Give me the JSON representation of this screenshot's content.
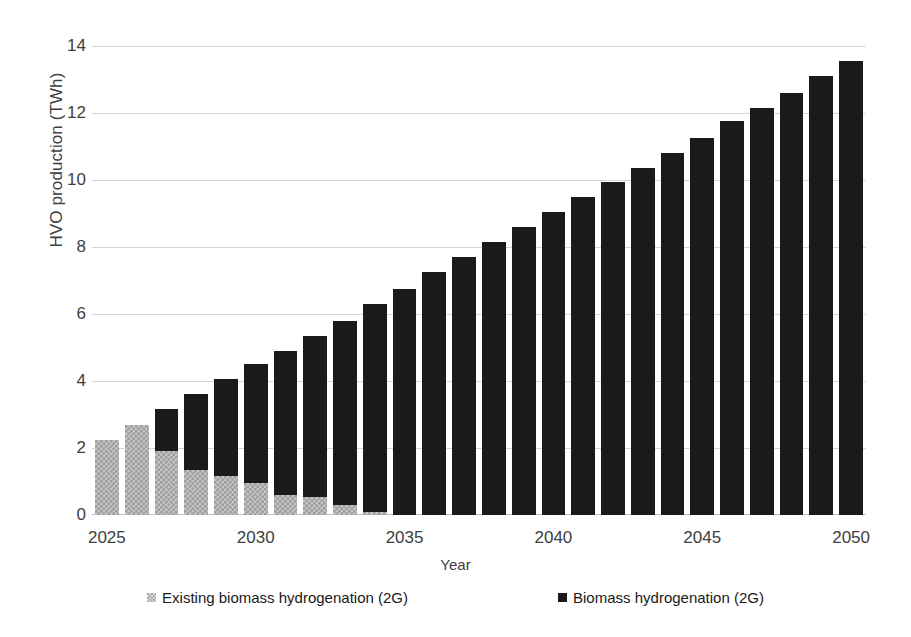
{
  "chart_data": {
    "type": "bar",
    "stacked": true,
    "title": "",
    "xlabel": "Year",
    "ylabel": "HVO production (TWh)",
    "categories": [
      2025,
      2026,
      2027,
      2028,
      2029,
      2030,
      2031,
      2032,
      2033,
      2034,
      2035,
      2036,
      2037,
      2038,
      2039,
      2040,
      2041,
      2042,
      2043,
      2044,
      2045,
      2046,
      2047,
      2048,
      2049,
      2050
    ],
    "x_tick_labels": [
      "2025",
      "2030",
      "2035",
      "2040",
      "2045",
      "2050"
    ],
    "x_tick_categories": [
      2025,
      2030,
      2035,
      2040,
      2045,
      2050
    ],
    "y_tick_labels": [
      "0",
      "2",
      "4",
      "6",
      "8",
      "10",
      "12",
      "14"
    ],
    "ylim": [
      0,
      14
    ],
    "y_tick_values": [
      0,
      2,
      4,
      6,
      8,
      10,
      12,
      14
    ],
    "grid": true,
    "legend_position": "bottom",
    "series": [
      {
        "name": "Existing biomass hydrogenation (2G)",
        "color": "#a8a8a8",
        "pattern": "checkered",
        "values": [
          2.25,
          2.7,
          1.9,
          1.35,
          1.15,
          0.95,
          0.6,
          0.55,
          0.3,
          0.1,
          0.0,
          0.0,
          0.0,
          0.0,
          0.0,
          0.0,
          0.0,
          0.0,
          0.0,
          0.0,
          0.0,
          0.0,
          0.0,
          0.0,
          0.0,
          0.0
        ]
      },
      {
        "name": "Biomass hydrogenation (2G)",
        "color": "#1a1a1a",
        "pattern": "solid",
        "values": [
          0.0,
          0.0,
          1.25,
          2.25,
          2.9,
          3.55,
          4.3,
          4.8,
          5.5,
          6.2,
          6.75,
          7.25,
          7.7,
          8.15,
          8.6,
          9.05,
          9.5,
          9.95,
          10.35,
          10.8,
          11.25,
          11.75,
          12.15,
          12.6,
          13.1,
          13.55
        ]
      }
    ],
    "totals": [
      2.25,
      2.7,
      3.15,
      3.6,
      4.05,
      4.5,
      4.9,
      5.35,
      5.8,
      6.3,
      6.75,
      7.25,
      7.7,
      8.15,
      8.6,
      9.05,
      9.5,
      9.95,
      10.35,
      10.8,
      11.25,
      11.75,
      12.15,
      12.6,
      13.1,
      13.55
    ]
  }
}
